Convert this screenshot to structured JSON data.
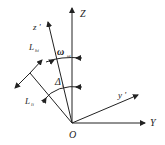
{
  "diagram": {
    "labels": {
      "Z": "Z",
      "z_prime": "z '",
      "y_prime": "y '",
      "Y": "Y",
      "O": "O",
      "omega": "ω",
      "omega_sub": "ω",
      "delta": "Δ",
      "delta_sub": "i",
      "L_top": "L",
      "L_top_sub": "hi",
      "L_bottom": "L",
      "L_bottom_sub": "li"
    },
    "colors": {
      "line": "#222222",
      "background": "#ffffff"
    }
  }
}
